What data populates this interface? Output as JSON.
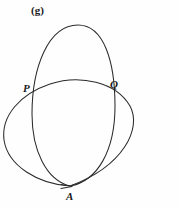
{
  "figure": {
    "part_label": "(g)",
    "background_color": "#fefefe",
    "stroke_color": "#2b2b2b",
    "labels": {
      "P": "P",
      "Q": "Q",
      "A": "A"
    }
  },
  "chart_data": {
    "type": "line",
    "title": "(g)",
    "xlabel": "",
    "ylabel": "",
    "grid": false,
    "legend": "none",
    "xlim": [
      0,
      179
    ],
    "ylim": [
      209,
      0
    ],
    "annotations": [
      {
        "text": "(g)",
        "x": 31,
        "y": 11
      },
      {
        "text": "P",
        "x": 23,
        "y": 89
      },
      {
        "text": "Q",
        "x": 110,
        "y": 85
      },
      {
        "text": "A",
        "x": 66,
        "y": 197
      }
    ],
    "points": [
      {
        "name": "P",
        "x": 33,
        "y": 95,
        "description": "upper-left intersection of the two closed curves"
      },
      {
        "name": "Q",
        "x": 108,
        "y": 92,
        "description": "upper-right intersection of the two closed curves"
      },
      {
        "name": "A",
        "x": 70,
        "y": 186,
        "description": "bottom node where both closed curves meet; arrowhead marks traversal direction"
      }
    ],
    "series": [
      {
        "name": "vertical-oval",
        "closed": true,
        "description": "tall narrow closed oval running from node A at bottom up to apex near the top",
        "path": "M 70 186 C 46 180 32 150 32 114 C 32 68 48 25 78 25 C 104 25 115 62 115 106 C 115 150 98 181 70 186 Z",
        "x": [
          70,
          32,
          78,
          115,
          70
        ],
        "y": [
          186,
          114,
          25,
          106,
          186
        ]
      },
      {
        "name": "wide-tilted-ellipse",
        "closed": true,
        "description": "wider tilted closed ellipse passing through P and Q and meeting the oval at node A",
        "path": "M 70 186 C 38 184 8 166 4 140 C 1 116 20 94 50 84 C 80 74 116 82 130 106 C 142 128 124 166 70 186 Z",
        "x": [
          70,
          4,
          50,
          130,
          70
        ],
        "y": [
          186,
          140,
          84,
          106,
          186
        ]
      }
    ]
  }
}
